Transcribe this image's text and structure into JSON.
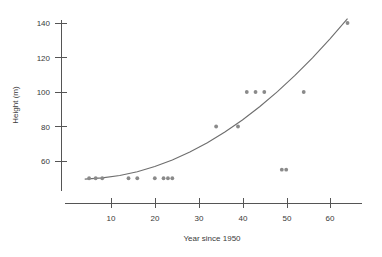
{
  "chart_data": {
    "type": "scatter",
    "title": "",
    "xlabel": "Year since 1950",
    "ylabel": "Height (m)",
    "xlim": [
      1.5,
      69
    ],
    "ylim": [
      44,
      148
    ],
    "grid": false,
    "legend": null,
    "xticks": [
      10,
      20,
      30,
      40,
      50,
      60
    ],
    "xtick_labels": [
      "10",
      "20",
      "30",
      "40",
      "50",
      "60"
    ],
    "yticks": [
      60,
      80,
      100,
      120,
      140
    ],
    "ytick_labels": [
      "60",
      "80",
      "100",
      "120",
      "140"
    ],
    "point_color": "#8a8a8a",
    "curve_color": "#6e6e6e",
    "axis_color": "#555555",
    "x": [
      5,
      6.5,
      8,
      14,
      16,
      20,
      22,
      23,
      24,
      34,
      39,
      41,
      43,
      45,
      49,
      50,
      54,
      64
    ],
    "y": [
      50,
      50,
      50,
      50,
      50,
      50,
      50,
      50,
      50,
      80,
      80,
      100,
      100,
      100,
      55,
      55,
      100,
      140
    ],
    "points": [
      {
        "x": 5,
        "y": 50
      },
      {
        "x": 6.5,
        "y": 50
      },
      {
        "x": 8,
        "y": 50
      },
      {
        "x": 14,
        "y": 50
      },
      {
        "x": 16,
        "y": 50
      },
      {
        "x": 20,
        "y": 50
      },
      {
        "x": 22,
        "y": 50
      },
      {
        "x": 23,
        "y": 50
      },
      {
        "x": 24,
        "y": 50
      },
      {
        "x": 34,
        "y": 80
      },
      {
        "x": 39,
        "y": 80
      },
      {
        "x": 41,
        "y": 100
      },
      {
        "x": 43,
        "y": 100
      },
      {
        "x": 45,
        "y": 100
      },
      {
        "x": 49,
        "y": 55
      },
      {
        "x": 50,
        "y": 55
      },
      {
        "x": 54,
        "y": 100
      },
      {
        "x": 64,
        "y": 140
      }
    ],
    "curve": {
      "label": "fitted curve",
      "x": [
        4,
        8,
        12,
        16,
        20,
        24,
        28,
        32,
        36,
        40,
        44,
        48,
        52,
        56,
        60,
        64
      ],
      "y": [
        49.5,
        50.2,
        51.6,
        53.8,
        56.8,
        60.6,
        65.2,
        70.6,
        76.8,
        83.8,
        91.6,
        100.2,
        109.6,
        119.8,
        130.8,
        142.6
      ]
    }
  }
}
